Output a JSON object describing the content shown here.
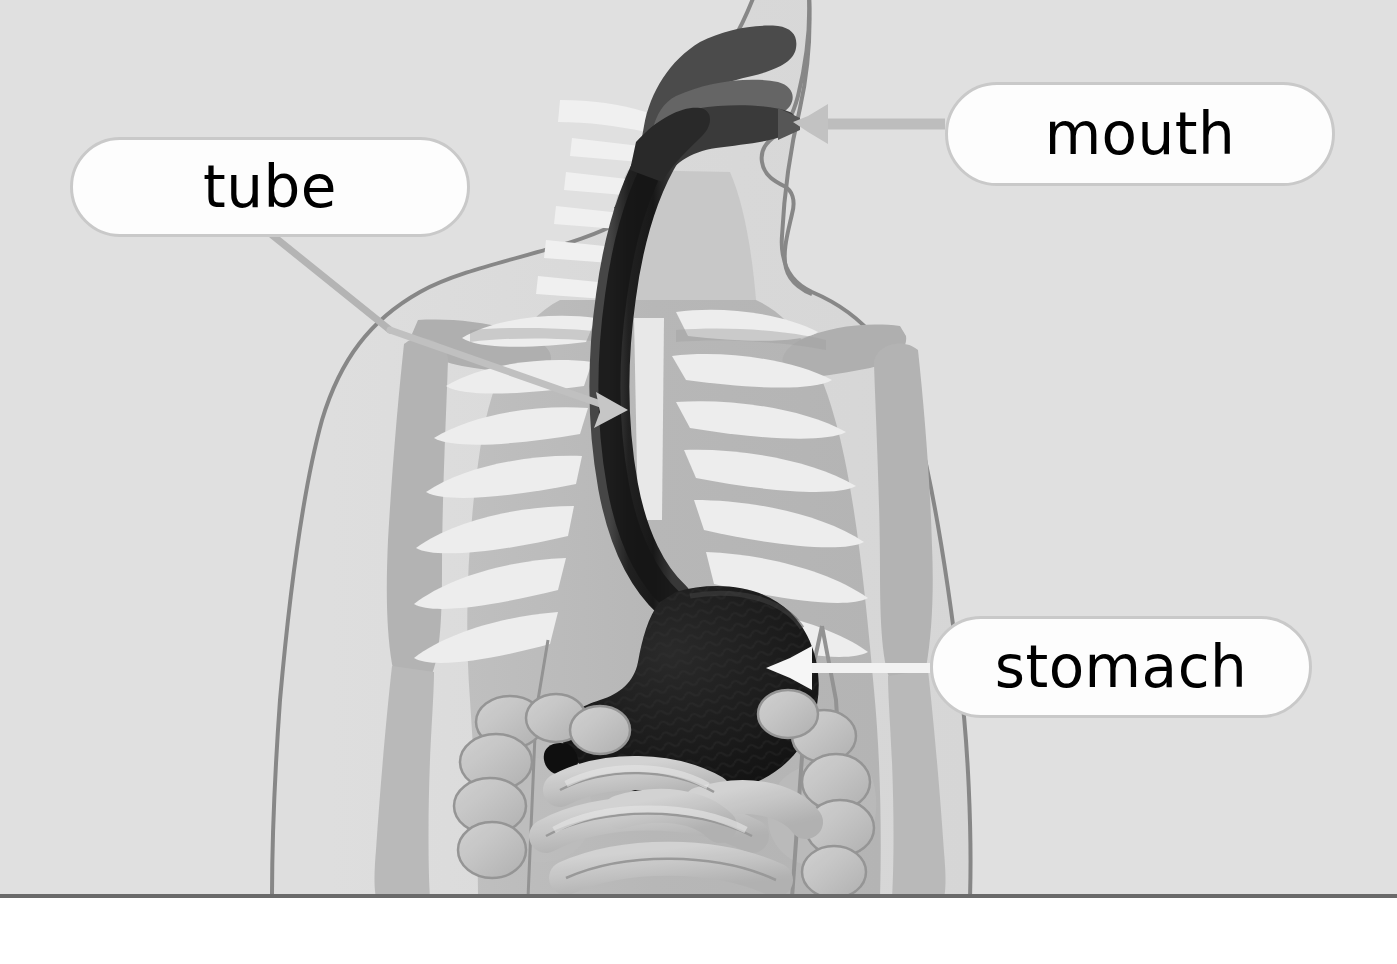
{
  "figure": {
    "background_color": "#ebebeb",
    "page_color": "#ffffff",
    "border_color": "#6a6a6a"
  },
  "labels": [
    {
      "id": "tube",
      "text": "tube",
      "box": {
        "x": 70,
        "y": 137,
        "w": 400,
        "h": 100
      },
      "leader": "bent line from bottom-left of box down-right to the esophagus",
      "pointer_target": "esophagus",
      "pointer_color": "#b9b9b9",
      "box_fill": "#fdfdfd",
      "box_border": "#c9c9c9",
      "text_color": "#000000"
    },
    {
      "id": "mouth",
      "text": "mouth",
      "box": {
        "x": 945,
        "y": 82,
        "w": 390,
        "h": 104
      },
      "leader": "horizontal line from left edge of box to an arrowhead at the lips",
      "pointer_target": "mouth-opening",
      "pointer_color": "#b9b9b9",
      "box_fill": "#fdfdfd",
      "box_border": "#c9c9c9",
      "text_color": "#000000"
    },
    {
      "id": "stomach",
      "text": "stomach",
      "box": {
        "x": 930,
        "y": 616,
        "w": 382,
        "h": 102
      },
      "leader": "horizontal white line from left edge of box to an arrowhead inside the stomach",
      "pointer_target": "stomach-organ",
      "pointer_color": "#ffffff",
      "box_fill": "#fdfdfd",
      "box_border": "#c9c9c9",
      "text_color": "#000000"
    }
  ],
  "anatomy": [
    {
      "id": "body-silhouette",
      "name": "body silhouette",
      "color": "#e4e4e4",
      "outline": "#8c8c8c"
    },
    {
      "id": "torso-mass",
      "name": "torso / trunk mass",
      "color": "#c3c3c3"
    },
    {
      "id": "ribcage",
      "name": "rib cage",
      "color": "#f7f7f7"
    },
    {
      "id": "spine",
      "name": "spine and cervical vertebrae",
      "color": "#fbfbfb"
    },
    {
      "id": "arm-bones",
      "name": "arm bones (humerus, radius, ulna)",
      "color": "#d2d2d2"
    },
    {
      "id": "pelvis",
      "name": "pelvis",
      "color": "#c9c9c9"
    },
    {
      "id": "mouth-cavity",
      "name": "mouth cavity and tongue",
      "color": "#5c5c5c"
    },
    {
      "id": "esophagus",
      "name": "esophagus (tube)",
      "color": "#2e2e2e"
    },
    {
      "id": "stomach-organ",
      "name": "stomach",
      "color": "#1a1a1a"
    },
    {
      "id": "small-intestine",
      "name": "small intestine",
      "color": "#cfcfcf"
    },
    {
      "id": "large-intestine",
      "name": "large intestine / colon",
      "color": "#d6d6d6"
    }
  ]
}
